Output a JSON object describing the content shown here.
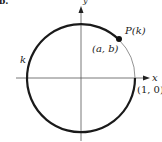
{
  "figure": {
    "part_label": "b.",
    "axes": {
      "x_label": "x",
      "y_label": "y"
    },
    "circle": {
      "type": "unit circle",
      "center": [
        0,
        0
      ],
      "radius": 1
    },
    "arc_label": "k",
    "point": {
      "name": "P(k)",
      "coords_label": "(a, b)"
    },
    "start_point_label": "(1, 0)",
    "colors": {
      "stroke": "#1a1a1a",
      "axis": "#555555",
      "thin_arc": "#777777"
    }
  }
}
